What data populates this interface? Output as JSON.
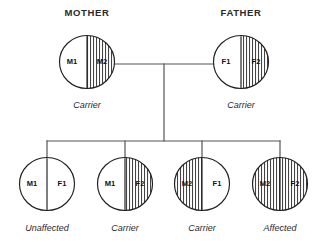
{
  "diagram": {
    "title_mother": "MOTHER",
    "title_father": "FATHER",
    "colors": {
      "stroke": "#1f1f1f",
      "link": "#555555",
      "hatch": "#3a3a3a",
      "background": "#ffffff"
    }
  },
  "parents": [
    {
      "id": "mother",
      "header": "MOTHER",
      "status": "Carrier",
      "left_allele": "M1",
      "right_allele": "M2",
      "left_fill": "plain",
      "right_fill": "hatch",
      "cx": 87,
      "cy": 62
    },
    {
      "id": "father",
      "header": "FATHER",
      "status": "Carrier",
      "left_allele": "F1",
      "right_allele": "F2",
      "left_fill": "plain",
      "right_fill": "hatch",
      "cx": 241,
      "cy": 62
    }
  ],
  "children": [
    {
      "id": "child-1",
      "status": "Unaffected",
      "left_allele": "M1",
      "right_allele": "F1",
      "left_fill": "plain",
      "right_fill": "plain",
      "cx": 47,
      "cy": 184
    },
    {
      "id": "child-2",
      "status": "Carrier",
      "left_allele": "M1",
      "right_allele": "F2",
      "left_fill": "plain",
      "right_fill": "hatch",
      "cx": 125,
      "cy": 184
    },
    {
      "id": "child-3",
      "status": "Carrier",
      "left_allele": "M2",
      "right_allele": "F1",
      "left_fill": "hatch",
      "right_fill": "plain",
      "cx": 202,
      "cy": 184
    },
    {
      "id": "child-4",
      "status": "Affected",
      "left_allele": "M2",
      "right_allele": "F2",
      "left_fill": "hatch",
      "right_fill": "hatch",
      "cx": 280,
      "cy": 184
    }
  ],
  "connections": {
    "mating_line_y": 64,
    "mating_line_x1": 115,
    "mating_line_x2": 214,
    "descent_x": 164,
    "descent_y1": 64,
    "descent_y2": 141,
    "sibship_y": 141,
    "sibship_x1": 47,
    "sibship_x2": 280
  }
}
